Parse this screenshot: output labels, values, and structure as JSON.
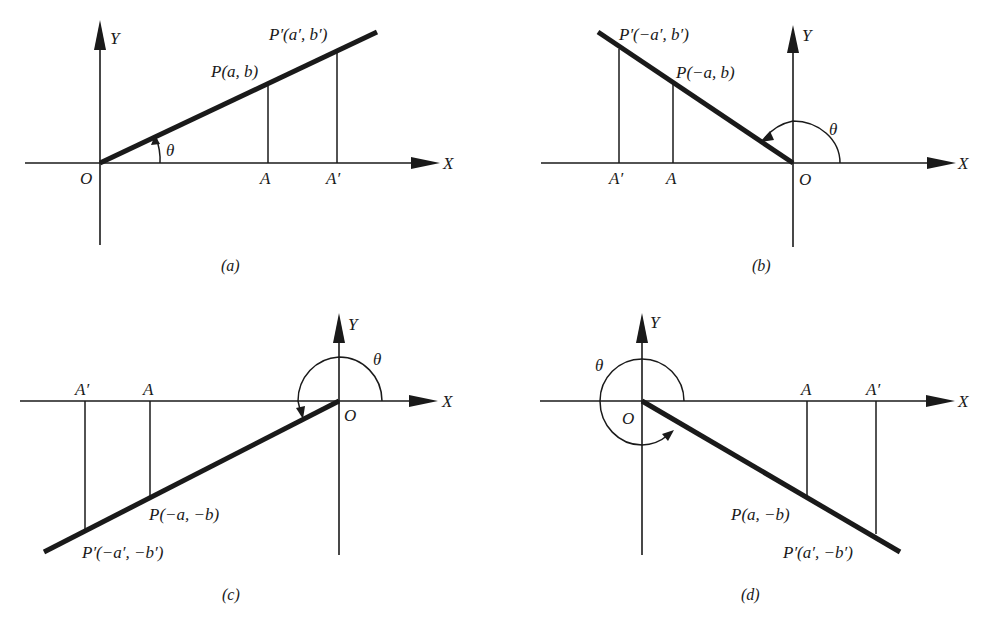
{
  "figure": {
    "panels": [
      {
        "id": "a",
        "caption": "(a)",
        "x_axis_label": "X",
        "y_axis_label": "Y",
        "origin_label": "O",
        "angle_label": "θ",
        "foot_label_near": "A",
        "foot_label_far": "A′",
        "point_near": "P(a, b)",
        "point_far": "P′(a′, b′)",
        "quadrant": "I"
      },
      {
        "id": "b",
        "caption": "(b)",
        "x_axis_label": "X",
        "y_axis_label": "Y",
        "origin_label": "O",
        "angle_label": "θ",
        "foot_label_near": "A",
        "foot_label_far": "A′",
        "point_near": "P(−a, b)",
        "point_far": "P′(−a′, b′)",
        "quadrant": "II"
      },
      {
        "id": "c",
        "caption": "(c)",
        "x_axis_label": "X",
        "y_axis_label": "Y",
        "origin_label": "O",
        "angle_label": "θ",
        "foot_label_near": "A",
        "foot_label_far": "A′",
        "point_near": "P(−a, −b)",
        "point_far": "P′(−a′, −b′)",
        "quadrant": "III"
      },
      {
        "id": "d",
        "caption": "(d)",
        "x_axis_label": "X",
        "y_axis_label": "Y",
        "origin_label": "O",
        "angle_label": "θ",
        "foot_label_near": "A",
        "foot_label_far": "A′",
        "point_near": "P(a, −b)",
        "point_far": "P′(a′, −b′)",
        "quadrant": "IV"
      }
    ]
  },
  "colors": {
    "ink": "#1a1a1a",
    "background": "#ffffff"
  }
}
